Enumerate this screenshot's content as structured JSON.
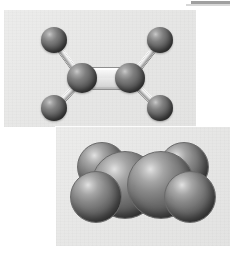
{
  "figure": {
    "background_color": "#ffffff",
    "width": 230,
    "height": 259,
    "scan_artifact": {
      "name": "page-edge-bar",
      "color": "#8e8e8e",
      "position": "top-right"
    }
  },
  "panels": [
    {
      "id": "ball-and-stick",
      "label": "Ball-and-stick model",
      "background_color": "#e8e8e7",
      "x": 4,
      "y": 10,
      "width": 192,
      "height": 117
    },
    {
      "id": "space-filling",
      "label": "Space-filling model",
      "background_color": "#e8e8e7",
      "x": 56,
      "y": 127,
      "width": 174,
      "height": 119
    }
  ],
  "molecule": {
    "name": "Ethylene",
    "formula": "C2H4",
    "bond_type": "double bond",
    "atom_color": "#4c4c4c",
    "bond_color": "#c9c9c9"
  },
  "ball_and_stick": {
    "atoms": [
      {
        "element": "H",
        "label": "hydrogen-top-left",
        "cx": 50,
        "cy": 30,
        "r": 13
      },
      {
        "element": "H",
        "label": "hydrogen-bottom-left",
        "cx": 50,
        "cy": 98,
        "r": 13
      },
      {
        "element": "C",
        "label": "carbon-left",
        "cx": 78,
        "cy": 68,
        "r": 15
      },
      {
        "element": "C",
        "label": "carbon-right",
        "cx": 126,
        "cy": 68,
        "r": 15
      },
      {
        "element": "H",
        "label": "hydrogen-top-right",
        "cx": 156,
        "cy": 30,
        "r": 13
      },
      {
        "element": "H",
        "label": "hydrogen-bottom-right",
        "cx": 156,
        "cy": 98,
        "r": 13
      }
    ],
    "bonds": [
      {
        "from": "hydrogen-top-left",
        "to": "carbon-left",
        "order": 1
      },
      {
        "from": "hydrogen-bottom-left",
        "to": "carbon-left",
        "order": 1
      },
      {
        "from": "carbon-left",
        "to": "carbon-right",
        "order": 2
      },
      {
        "from": "carbon-right",
        "to": "hydrogen-top-right",
        "order": 1
      },
      {
        "from": "carbon-right",
        "to": "hydrogen-bottom-right",
        "order": 1
      }
    ]
  },
  "space_filling": {
    "spheres": [
      {
        "element": "H",
        "label": "hydrogen-back-left",
        "cx": 46,
        "cy": 40,
        "r": 25
      },
      {
        "element": "H",
        "label": "hydrogen-back-right",
        "cx": 128,
        "cy": 40,
        "r": 25
      },
      {
        "element": "H",
        "label": "hydrogen-front-left",
        "cx": 40,
        "cy": 70,
        "r": 26
      },
      {
        "element": "H",
        "label": "hydrogen-front-right",
        "cx": 134,
        "cy": 70,
        "r": 26
      },
      {
        "element": "C",
        "label": "carbon-left",
        "cx": 69,
        "cy": 58,
        "r": 34
      },
      {
        "element": "C",
        "label": "carbon-right",
        "cx": 105,
        "cy": 58,
        "r": 34
      }
    ]
  }
}
